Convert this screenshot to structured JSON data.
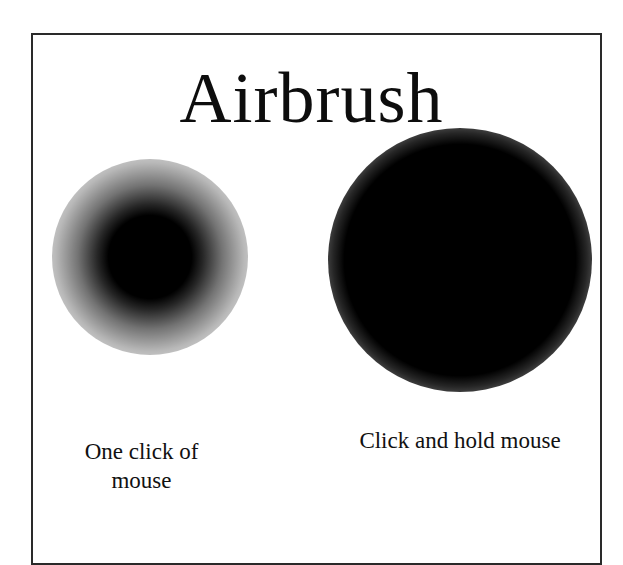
{
  "title": "Airbrush",
  "examples": [
    {
      "id": "one-click",
      "caption_line1": "One click of",
      "caption_line2": "mouse",
      "spot_size": "small"
    },
    {
      "id": "click-and-hold",
      "caption": "Click and hold mouse",
      "spot_size": "large"
    }
  ],
  "colors": {
    "ink": "#000000",
    "background": "#ffffff",
    "border": "#2a2a2a"
  }
}
